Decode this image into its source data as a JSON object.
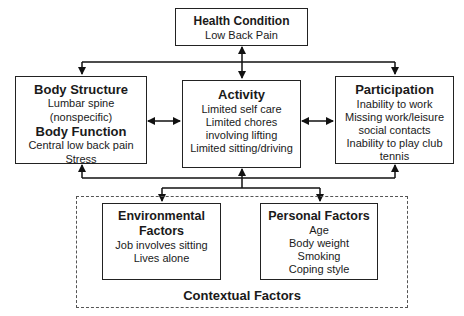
{
  "health": {
    "title": "Health Condition",
    "lines": [
      "Low Back Pain"
    ]
  },
  "body": {
    "title1": "Body Structure",
    "lines1": [
      "Lumbar spine",
      "(nonspecific)"
    ],
    "title2": "Body Function",
    "lines2": [
      "Central low back pain",
      "Stress"
    ]
  },
  "activity": {
    "title": "Activity",
    "lines": [
      "Limited self care",
      "Limited chores",
      "involving lifting",
      "Limited sitting/driving"
    ]
  },
  "participation": {
    "title": "Participation",
    "lines": [
      "Inability to work",
      "Missing work/leisure",
      "social contacts",
      "Inability to play club",
      "tennis"
    ]
  },
  "environmental": {
    "title": [
      "Environmental",
      "Factors"
    ],
    "lines": [
      "Job involves sitting",
      "Lives alone"
    ]
  },
  "personal": {
    "title": "Personal Factors",
    "lines": [
      "Age",
      "Body weight",
      "Smoking",
      "Coping style"
    ]
  },
  "contextual": {
    "label": "Contextual Factors"
  }
}
